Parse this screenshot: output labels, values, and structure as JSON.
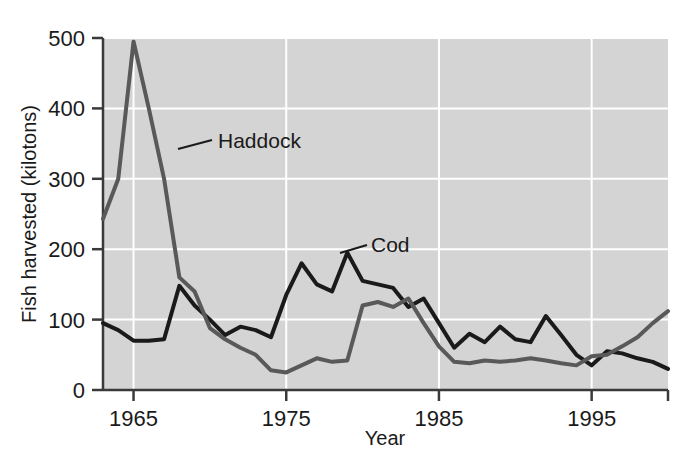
{
  "chart_data": {
    "type": "line",
    "title": "",
    "xlabel": "Year",
    "ylabel": "Fish harvested (kilotons)",
    "xlim": [
      1963,
      2000
    ],
    "ylim": [
      0,
      500
    ],
    "grid": true,
    "legend_position": "inline-annotation",
    "x_ticks": [
      1965,
      1975,
      1985,
      1995
    ],
    "x_tick_labels": [
      "1965",
      "1975",
      "1985",
      "1995"
    ],
    "y_ticks": [
      0,
      100,
      200,
      300,
      400,
      500
    ],
    "y_tick_labels": [
      "0",
      "100",
      "200",
      "300",
      "400",
      "500"
    ],
    "x": [
      1963,
      1964,
      1965,
      1966,
      1967,
      1968,
      1969,
      1970,
      1971,
      1972,
      1973,
      1974,
      1975,
      1976,
      1977,
      1978,
      1979,
      1980,
      1981,
      1982,
      1983,
      1984,
      1985,
      1986,
      1987,
      1988,
      1989,
      1990,
      1991,
      1992,
      1993,
      1994,
      1995,
      1996,
      1997,
      1998,
      1999,
      2000
    ],
    "series": [
      {
        "name": "Cod",
        "color": "#1a1a1a",
        "values": [
          95,
          85,
          70,
          70,
          72,
          148,
          120,
          100,
          78,
          90,
          85,
          75,
          135,
          180,
          150,
          140,
          195,
          155,
          150,
          145,
          118,
          130,
          95,
          60,
          80,
          68,
          90,
          72,
          68,
          105,
          78,
          50,
          35,
          55,
          52,
          45,
          40,
          30
        ],
        "label_annotation": {
          "text": "Cod",
          "points_to_x": 1979,
          "points_to_y": 195
        }
      },
      {
        "name": "Haddock",
        "color": "#595959",
        "values": [
          243,
          300,
          495,
          400,
          300,
          160,
          140,
          88,
          72,
          60,
          50,
          28,
          25,
          35,
          45,
          40,
          42,
          120,
          125,
          118,
          130,
          95,
          62,
          40,
          38,
          42,
          40,
          42,
          45,
          42,
          38,
          35,
          48,
          50,
          62,
          75,
          95,
          112
        ],
        "label_annotation": {
          "text": "Haddock",
          "points_to_x": 1966,
          "points_to_y": 360
        }
      }
    ]
  },
  "figure": {
    "plot_background_color": "#d4d4d4",
    "gridline_color": "#ffffff",
    "axis_color": "#3a3a3a",
    "page_background_color": "#ffffff"
  }
}
